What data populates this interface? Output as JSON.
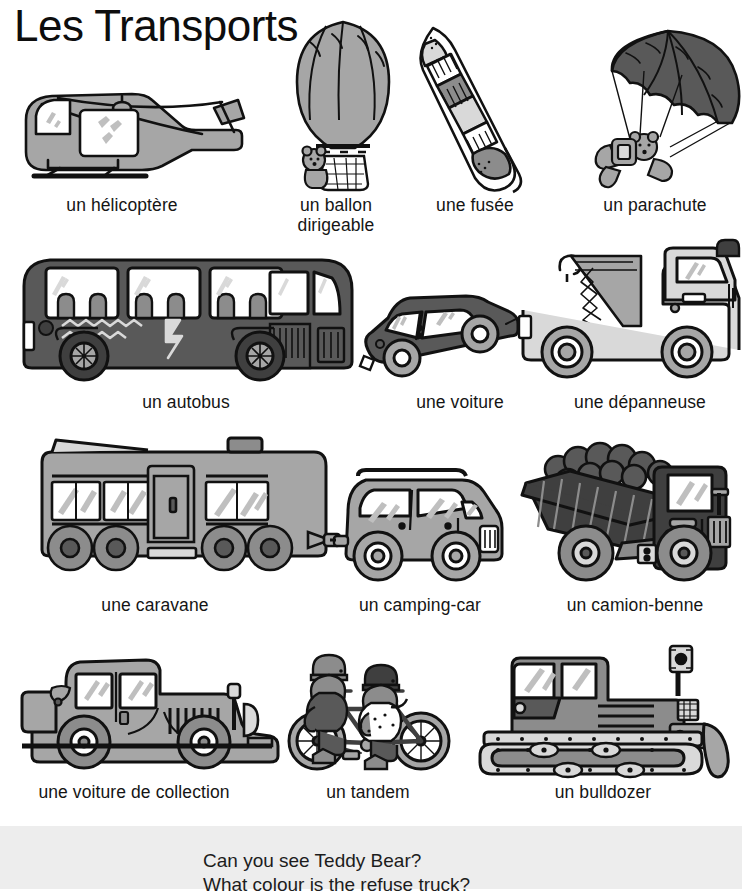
{
  "page": {
    "title": "Les Transports",
    "background_color": "#ffffff",
    "ink_color": "#111111",
    "palette": {
      "light_gray": "#d9d9d9",
      "mid_gray": "#a6a6a6",
      "dark_gray": "#595959",
      "darker_gray": "#3f3f3f",
      "white": "#ffffff",
      "strip_gray": "#ededed"
    }
  },
  "items": [
    {
      "id": "helicopter",
      "label": "un hélicoptère",
      "row": 1,
      "col": 1
    },
    {
      "id": "airship",
      "label": "un ballon\ndirigeable",
      "row": 1,
      "col": 2
    },
    {
      "id": "rocket",
      "label": "une fusée",
      "row": 1,
      "col": 3
    },
    {
      "id": "parachute",
      "label": "un parachute",
      "row": 1,
      "col": 4
    },
    {
      "id": "bus",
      "label": "un autobus",
      "row": 2,
      "col": 1
    },
    {
      "id": "car",
      "label": "une voiture",
      "row": 2,
      "col": 2
    },
    {
      "id": "tow-truck",
      "label": "une dépanneuse",
      "row": 2,
      "col": 3
    },
    {
      "id": "caravan",
      "label": "une caravane",
      "row": 3,
      "col": 1
    },
    {
      "id": "camper-van",
      "label": "un camping-car",
      "row": 3,
      "col": 2
    },
    {
      "id": "dump-truck",
      "label": "un camion-benne",
      "row": 3,
      "col": 3
    },
    {
      "id": "vintage-car",
      "label": "une voiture de collection",
      "row": 4,
      "col": 1
    },
    {
      "id": "tandem",
      "label": "un tandem",
      "row": 4,
      "col": 2
    },
    {
      "id": "bulldozer",
      "label": "un bulldozer",
      "row": 4,
      "col": 3
    }
  ],
  "questions": {
    "line1": "Can you see Teddy Bear?",
    "line2": "What colour is the refuse truck?"
  }
}
